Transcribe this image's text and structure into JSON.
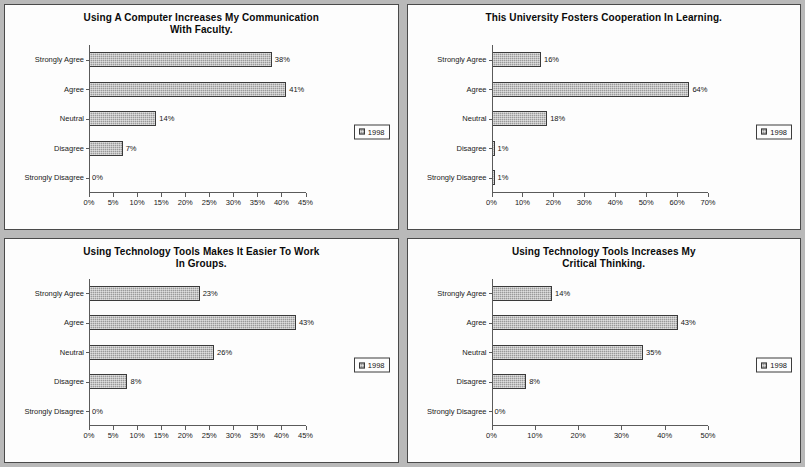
{
  "page": {
    "background_color": "#b9b9b9",
    "panel_background": "#fdfdfd",
    "bar_color": "#9a9a9a",
    "bar_border_color": "#3a3a3a",
    "axis_color": "#5a5a5a",
    "legend_label": "1998"
  },
  "charts": [
    {
      "id": "chart-computer-communication-faculty",
      "title_line1": "Using A Computer Increases My Communication",
      "title_line2": "With Faculty.",
      "legend_label": "1998",
      "chart_data": {
        "type": "bar",
        "orientation": "horizontal",
        "title": "Using A Computer Increases My Communication With Faculty.",
        "xlabel": "",
        "ylabel": "",
        "categories": [
          "Strongly Agree",
          "Agree",
          "Neutral",
          "Disagree",
          "Strongly Disagree"
        ],
        "values": [
          38,
          41,
          14,
          7,
          0
        ],
        "value_labels": [
          "38%",
          "41%",
          "14%",
          "7%",
          "0%"
        ],
        "series": [
          {
            "name": "1998",
            "values": [
              38,
              41,
              14,
              7,
              0
            ]
          }
        ],
        "xlim": [
          0,
          45
        ],
        "xticks": [
          0,
          5,
          10,
          15,
          20,
          25,
          30,
          35,
          40,
          45
        ],
        "xtick_labels": [
          "0%",
          "5%",
          "10%",
          "15%",
          "20%",
          "25%",
          "30%",
          "35%",
          "40%",
          "45%"
        ],
        "grid": false,
        "legend_position": "right"
      }
    },
    {
      "id": "chart-university-fosters-cooperation",
      "title_line1": "This University Fosters Cooperation In Learning.",
      "title_line2": "",
      "legend_label": "1998",
      "chart_data": {
        "type": "bar",
        "orientation": "horizontal",
        "title": "This University Fosters Cooperation In Learning.",
        "xlabel": "",
        "ylabel": "",
        "categories": [
          "Strongly Agree",
          "Agree",
          "Neutral",
          "Disagree",
          "Strongly Disagree"
        ],
        "values": [
          16,
          64,
          18,
          1,
          1
        ],
        "value_labels": [
          "16%",
          "64%",
          "18%",
          "1%",
          "1%"
        ],
        "series": [
          {
            "name": "1998",
            "values": [
              16,
              64,
              18,
              1,
              1
            ]
          }
        ],
        "xlim": [
          0,
          70
        ],
        "xticks": [
          0,
          10,
          20,
          30,
          40,
          50,
          60,
          70
        ],
        "xtick_labels": [
          "0%",
          "10%",
          "20%",
          "30%",
          "40%",
          "50%",
          "60%",
          "70%"
        ],
        "grid": false,
        "legend_position": "right"
      }
    },
    {
      "id": "chart-technology-tools-work-in-groups",
      "title_line1": "Using Technology Tools Makes It Easier To Work",
      "title_line2": "In Groups.",
      "legend_label": "1998",
      "chart_data": {
        "type": "bar",
        "orientation": "horizontal",
        "title": "Using Technology Tools Makes It Easier To Work In Groups.",
        "xlabel": "",
        "ylabel": "",
        "categories": [
          "Strongly Agree",
          "Agree",
          "Neutral",
          "Disagree",
          "Strongly Disagree"
        ],
        "values": [
          23,
          43,
          26,
          8,
          0
        ],
        "value_labels": [
          "23%",
          "43%",
          "26%",
          "8%",
          "0%"
        ],
        "series": [
          {
            "name": "1998",
            "values": [
              23,
              43,
              26,
              8,
              0
            ]
          }
        ],
        "xlim": [
          0,
          45
        ],
        "xticks": [
          0,
          5,
          10,
          15,
          20,
          25,
          30,
          35,
          40,
          45
        ],
        "xtick_labels": [
          "0%",
          "5%",
          "10%",
          "15%",
          "20%",
          "25%",
          "30%",
          "35%",
          "40%",
          "45%"
        ],
        "grid": false,
        "legend_position": "right"
      }
    },
    {
      "id": "chart-technology-tools-critical-thinking",
      "title_line1": "Using Technology Tools Increases My",
      "title_line2": "Critical Thinking.",
      "legend_label": "1998",
      "chart_data": {
        "type": "bar",
        "orientation": "horizontal",
        "title": "Using Technology Tools Increases My Critical Thinking.",
        "xlabel": "",
        "ylabel": "",
        "categories": [
          "Strongly Agree",
          "Agree",
          "Neutral",
          "Disagree",
          "Strongly Disagree"
        ],
        "values": [
          14,
          43,
          35,
          8,
          0
        ],
        "value_labels": [
          "14%",
          "43%",
          "35%",
          "8%",
          "0%"
        ],
        "series": [
          {
            "name": "1998",
            "values": [
              14,
              43,
              35,
              8,
              0
            ]
          }
        ],
        "xlim": [
          0,
          50
        ],
        "xticks": [
          0,
          10,
          20,
          30,
          40,
          50
        ],
        "xtick_labels": [
          "0%",
          "10%",
          "20%",
          "30%",
          "40%",
          "50%"
        ],
        "grid": false,
        "legend_position": "right"
      }
    }
  ]
}
